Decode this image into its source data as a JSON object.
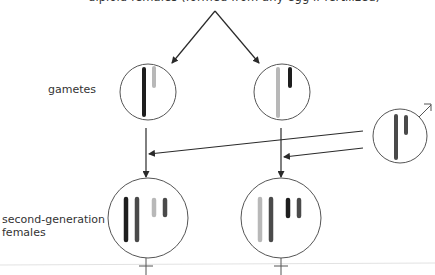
{
  "title": "diploid females (formed from any egg if fertilized)",
  "labels": {
    "gametes": "gametes",
    "second_generation_line1": "second-generation",
    "second_generation_line2": "females"
  },
  "colors": {
    "black": "#1e1e1e",
    "dark_gray": "#4a4a4a",
    "light_gray": "#b8b8b8",
    "outline": "#555555",
    "arrow": "#2a2a2a",
    "rule": "#dddddd"
  },
  "cells": {
    "gamete_left": {
      "sex": "egg",
      "chromosomes": [
        "long-black",
        "short-light-gray"
      ]
    },
    "gamete_right": {
      "sex": "egg",
      "chromosomes": [
        "long-light-gray",
        "short-black"
      ]
    },
    "male": {
      "sex": "male",
      "symbol": "male-symbol",
      "chromosomes": [
        "long-dark-gray",
        "short-dark-gray"
      ]
    },
    "female_left": {
      "sex": "female",
      "symbol": "female-symbol",
      "chromosomes": [
        "long-black",
        "long-dark-gray",
        "short-light-gray",
        "short-dark-gray"
      ]
    },
    "female_right": {
      "sex": "female",
      "symbol": "female-symbol",
      "chromosomes": [
        "long-light-gray",
        "long-dark-gray",
        "short-black",
        "short-dark-gray"
      ]
    }
  }
}
